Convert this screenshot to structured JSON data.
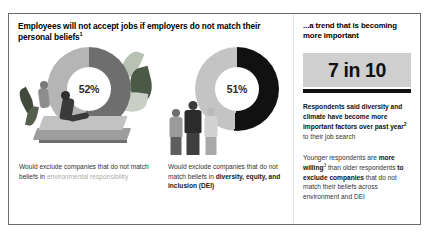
{
  "left": {
    "headline": "Employees will not accept jobs if employers do not match their personal beliefs",
    "headline_footnote": "1",
    "charts": [
      {
        "value_label": "52%",
        "percent": 52,
        "caption_line1": "Would exclude companies that",
        "caption_line2": "do not match beliefs in",
        "caption_highlight": "environmental responsibility",
        "illustration": "person-on-laptop-with-plants"
      },
      {
        "value_label": "51%",
        "percent": 51,
        "caption_line1": "Would exclude companies that do",
        "caption_line2": "not match beliefs in ",
        "caption_bold": "diversity, equity, and inclusion (DEI)",
        "illustration": "three-standing-people"
      }
    ]
  },
  "right": {
    "title": "...a trend that is becoming more important",
    "stat_value": "7 in 10",
    "paragraph1_bold": "Respondents said diversity and climate have become more important factors over past year",
    "paragraph1_footnote": "2",
    "paragraph1_regular": " to their job search",
    "paragraph2_part1": "Younger respondents are ",
    "paragraph2_bold1": "more willing",
    "paragraph2_footnote": "3",
    "paragraph2_part2": " than older respondents ",
    "paragraph2_bold2": "to exclude companies",
    "paragraph2_part3": " that do not match their beliefs across environment and DEI"
  },
  "chart_data": {
    "type": "pie",
    "title": "Employees will not accept jobs if employers do not match their personal beliefs",
    "charts": [
      {
        "name": "environmental responsibility",
        "labels": [
          "Would exclude",
          "Would not exclude"
        ],
        "values": [
          52,
          48
        ],
        "display_label": "52%",
        "colors": [
          "#6e6e6e",
          "#b5b5b5"
        ]
      },
      {
        "name": "diversity, equity, and inclusion (DEI)",
        "labels": [
          "Would exclude",
          "Would not exclude"
        ],
        "values": [
          51,
          49
        ],
        "display_label": "51%",
        "colors": [
          "#111111",
          "#c4c4c4"
        ]
      }
    ],
    "callout": {
      "label": "7 in 10",
      "value": 70,
      "unit": "percent"
    },
    "legend": false,
    "grid": false
  },
  "colors": {
    "dark_segment_a": "#6e6e6e",
    "light_segment_a": "#b5b5b5",
    "dark_segment_b": "#111111",
    "light_segment_b": "#c4c4c4",
    "stat_box_bg": "#cfcfcf",
    "rule": "#111111",
    "muted_text": "#a8b0a4"
  }
}
